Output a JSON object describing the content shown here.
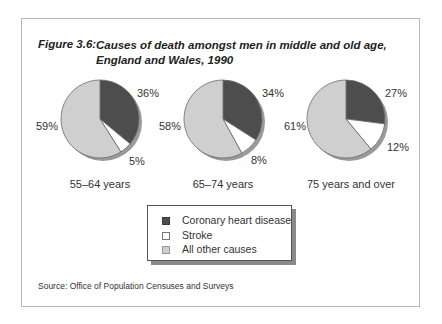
{
  "figure": {
    "label": "Figure 3.6:",
    "title_line1": "Causes of death amongst men in middle and old age,",
    "title_line2": "England and Wales, 1990"
  },
  "colors": {
    "coronary": "#4d4d4d",
    "stroke": "#ffffff",
    "other": "#cfcfcf"
  },
  "pies": [
    {
      "age": "55–64 years",
      "coronary": "36%",
      "stroke": "5%",
      "other": "59%"
    },
    {
      "age": "65–74 years",
      "coronary": "34%",
      "stroke": "8%",
      "other": "58%"
    },
    {
      "age": "75 years and over",
      "coronary": "27%",
      "stroke": "12%",
      "other": "61%"
    }
  ],
  "legend": {
    "items": [
      {
        "label": "Coronary heart disease"
      },
      {
        "label": "Stroke"
      },
      {
        "label": "All other causes"
      }
    ]
  },
  "source": "Source: Office of Population Censuses and Surveys",
  "chart_data": {
    "type": "pie",
    "categories": [
      "Coronary heart disease",
      "Stroke",
      "All other causes"
    ],
    "series": [
      {
        "name": "55–64 years",
        "values": [
          36,
          5,
          59
        ]
      },
      {
        "name": "65–74 years",
        "values": [
          34,
          8,
          58
        ]
      },
      {
        "name": "75 years and over",
        "values": [
          27,
          12,
          61
        ]
      }
    ],
    "legend_position": "bottom-center",
    "source": "Office of Population Censuses and Surveys"
  }
}
